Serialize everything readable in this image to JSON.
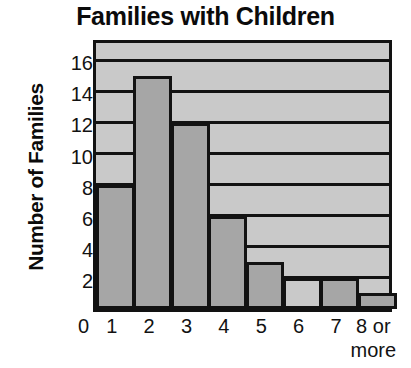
{
  "chart_data": {
    "type": "bar",
    "title": "Families with Children",
    "xlabel": "",
    "ylabel": "Number of Families",
    "categories": [
      "1",
      "2",
      "3",
      "4",
      "5",
      "6",
      "7",
      "8 or more"
    ],
    "category_lines": [
      [
        "1"
      ],
      [
        "2"
      ],
      [
        "3"
      ],
      [
        "4"
      ],
      [
        "5"
      ],
      [
        "6"
      ],
      [
        "7"
      ],
      [
        "8 or",
        "more"
      ]
    ],
    "values": [
      8,
      15,
      12,
      6,
      3,
      2,
      2,
      1
    ],
    "ylim": [
      0,
      17.5
    ],
    "ytick_values": [
      0,
      2,
      4,
      6,
      8,
      10,
      12,
      14,
      16
    ],
    "ytick_labels": [
      "0",
      "2",
      "4",
      "6",
      "8",
      "10",
      "12",
      "14",
      "16"
    ],
    "grid": "horizontal",
    "gridline_values": [
      2,
      4,
      6,
      8,
      10,
      12,
      14,
      16
    ],
    "legend": null,
    "bar_fill_styles": [
      "dark",
      "dark",
      "dark",
      "dark",
      "dark",
      "light",
      "dark",
      "dark"
    ],
    "colors": {
      "bar_fill": "#a6a6a6",
      "bar_fill_light": "#c9c9c9",
      "plot_background": "#c9c9c9",
      "axis": "#121212",
      "text": "#0b0b0b",
      "page_background": "#ffffff"
    }
  }
}
